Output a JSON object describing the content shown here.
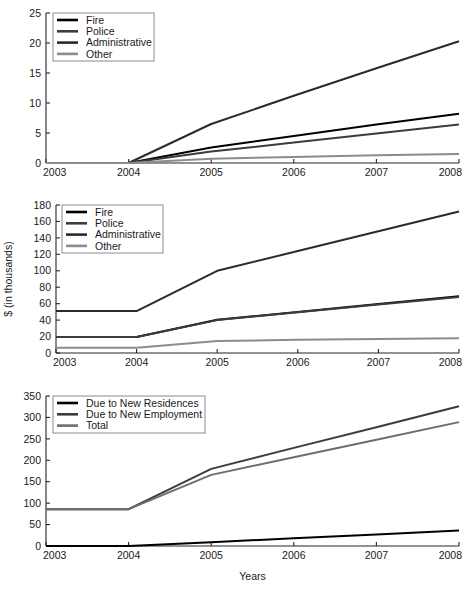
{
  "figure": {
    "background": "#ffffff",
    "xlabel": "Years",
    "panel_count": 3
  },
  "chart_data": [
    {
      "id": "panel-1",
      "type": "line",
      "title": "",
      "xlabel": "",
      "ylabel": "",
      "x": [
        2003,
        2004,
        2005,
        2006,
        2007,
        2008
      ],
      "xlim": [
        2003,
        2008
      ],
      "ylim": [
        0,
        25
      ],
      "xticks": [
        "2003",
        "2004",
        "2005",
        "2006",
        "2007",
        "2008"
      ],
      "yticks": [
        "0",
        "5",
        "10",
        "15",
        "20",
        "25"
      ],
      "grid": false,
      "legend_position": "upper-left",
      "series": [
        {
          "name": "Fire",
          "color": "#000000",
          "values": [
            0,
            0,
            2.6,
            4.5,
            6.4,
            8.2
          ]
        },
        {
          "name": "Police",
          "color": "#3c3c3c",
          "values": [
            0,
            0,
            1.9,
            3.4,
            4.9,
            6.4
          ]
        },
        {
          "name": "Administrative",
          "color": "#2b2b2b",
          "values": [
            0,
            0,
            6.5,
            11.2,
            15.8,
            20.3
          ]
        },
        {
          "name": "Other",
          "color": "#8c8c8c",
          "values": [
            0,
            0,
            0.7,
            1.0,
            1.3,
            1.5
          ]
        }
      ]
    },
    {
      "id": "panel-2",
      "type": "line",
      "title": "",
      "xlabel": "",
      "ylabel": "$ (in thousands)",
      "x": [
        2003,
        2004,
        2005,
        2006,
        2007,
        2008
      ],
      "xlim": [
        2003,
        2008
      ],
      "ylim": [
        0,
        180
      ],
      "xticks": [
        "2003",
        "2004",
        "2005",
        "2006",
        "2007",
        "2008"
      ],
      "yticks": [
        "0",
        "20",
        "40",
        "60",
        "80",
        "100",
        "120",
        "140",
        "160",
        "180"
      ],
      "grid": false,
      "legend_position": "upper-left",
      "series": [
        {
          "name": "Fire",
          "color": "#000000",
          "values": [
            19.5,
            19.5,
            40.5,
            50.0,
            59.5,
            69.0
          ]
        },
        {
          "name": "Police",
          "color": "#3c3c3c",
          "values": [
            19.5,
            19.5,
            40.0,
            49.5,
            59.0,
            68.0
          ]
        },
        {
          "name": "Administrative",
          "color": "#2b2b2b",
          "values": [
            51.0,
            51.0,
            100.0,
            124.0,
            148.0,
            172.0
          ]
        },
        {
          "name": "Other",
          "color": "#8c8c8c",
          "values": [
            6.5,
            6.5,
            14.5,
            16.0,
            17.0,
            18.0
          ]
        }
      ]
    },
    {
      "id": "panel-3",
      "type": "line",
      "title": "",
      "xlabel": "Years",
      "ylabel": "",
      "x": [
        2003,
        2004,
        2005,
        2006,
        2007,
        2008
      ],
      "xlim": [
        2003,
        2008
      ],
      "ylim": [
        0,
        350
      ],
      "xticks": [
        "2003",
        "2004",
        "2005",
        "2006",
        "2007",
        "2008"
      ],
      "yticks": [
        "0",
        "50",
        "100",
        "150",
        "200",
        "250",
        "300",
        "350"
      ],
      "grid": false,
      "legend_position": "upper-left",
      "series": [
        {
          "name": "Due to New Residences",
          "color": "#000000",
          "values": [
            0,
            0,
            9,
            18,
            27,
            36
          ]
        },
        {
          "name": "Due to New Employment",
          "color": "#3c3c3c",
          "values": [
            86,
            86,
            180,
            229,
            277,
            326
          ]
        },
        {
          "name": "Total",
          "color": "#6e6e6e",
          "values": [
            86,
            86,
            166,
            207,
            248,
            289
          ]
        }
      ]
    }
  ],
  "panels": [
    {
      "legend": {
        "items": [
          {
            "label": "Fire"
          },
          {
            "label": "Police"
          },
          {
            "label": "Administrative"
          },
          {
            "label": "Other"
          }
        ]
      }
    },
    {
      "legend": {
        "items": [
          {
            "label": "Fire"
          },
          {
            "label": "Police"
          },
          {
            "label": "Administrative"
          },
          {
            "label": "Other"
          }
        ]
      }
    },
    {
      "legend": {
        "items": [
          {
            "label": "Due to New Residences"
          },
          {
            "label": "Due to New Employment"
          },
          {
            "label": "Total"
          }
        ]
      }
    }
  ]
}
